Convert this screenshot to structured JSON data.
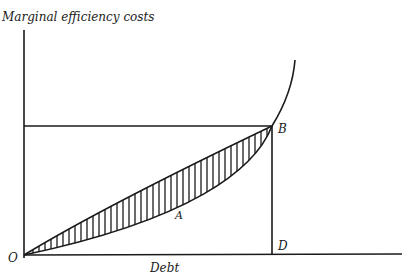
{
  "diagram": {
    "y_axis_label": "Marginal efficiency costs",
    "x_axis_label": "Debt",
    "points": {
      "origin": "O",
      "b": "B",
      "d": "D",
      "a": "A"
    },
    "colors": {
      "ink": "#1a1a1a",
      "background": "#ffffff"
    },
    "elements": [
      "y-axis",
      "x-axis",
      "horizontal line from axis to B",
      "vertical line from B to D",
      "upper curve O to B",
      "lower convex curve O through A to B, rising steeply beyond B",
      "hatched region between curves"
    ]
  }
}
